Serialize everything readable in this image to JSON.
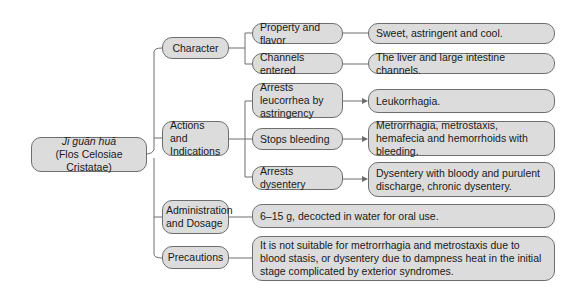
{
  "root": {
    "title": "Jī guān huā",
    "subtitle": "(Flos Celosiae Cristatae)"
  },
  "categories": [
    {
      "label": "Character",
      "items": [
        {
          "label": "Property and flavor",
          "detail": "Sweet, astringent and cool."
        },
        {
          "label": "Channels entered",
          "detail": "The liver and large intestine channels."
        }
      ]
    },
    {
      "label": "Actions and Indications",
      "items": [
        {
          "label": "Arrests leucorrhea by astringency",
          "detail": "Leukorrhagia."
        },
        {
          "label": "Stops bleeding",
          "detail": "Metrorrhagia, metrostaxis, hemafecia and hemorrhoids with bleeding."
        },
        {
          "label": "Arrests dysentery",
          "detail": "Dysentery with bloody and purulent discharge, chronic dysentery."
        }
      ]
    },
    {
      "label": "Administration and Dosage",
      "detail": "6–15 g, decocted in water for oral use."
    },
    {
      "label": "Precautions",
      "detail": "It is not suitable for metrorrhagia and metrostaxis due to blood stasis, or dysentery due to dampness heat in the initial stage complicated by exterior syndromes."
    }
  ],
  "colors": {
    "box_fill": "#dcdcdc",
    "box_border": "#6e6e6e",
    "line": "#6e6e6e"
  }
}
